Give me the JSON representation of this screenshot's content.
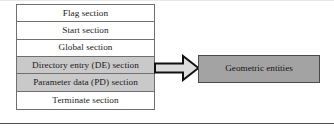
{
  "figure": {
    "name": "iges-file-structure-diagram",
    "colors": {
      "shaded_row_fill": "#c9c9c9",
      "plain_row_fill": "#ffffff",
      "row_border": "#6f6f6f",
      "target_box_fill": "#a3a3a3",
      "target_box_border": "#4a4a4a",
      "arrow_fill": "#dcdcdc",
      "arrow_outline": "#111111",
      "rule_color": "#4c4c4c",
      "text_color": "#1a1a1a"
    }
  },
  "section_table": {
    "name": "file-section-stack",
    "rows": [
      {
        "label": "Flag section",
        "shaded": false
      },
      {
        "label": "Start section",
        "shaded": false
      },
      {
        "label": "Global section",
        "shaded": false
      },
      {
        "label": "Directory entry (DE) section",
        "shaded": true
      },
      {
        "label": "Parameter data (PD) section",
        "shaded": true
      },
      {
        "label": "Terminate section",
        "shaded": false
      }
    ]
  },
  "arrow": {
    "name": "maps-to-arrow",
    "direction": "right",
    "from": "Directory entry (DE) section",
    "to": "Geometric entities"
  },
  "target": {
    "label": "Geometric entities"
  }
}
